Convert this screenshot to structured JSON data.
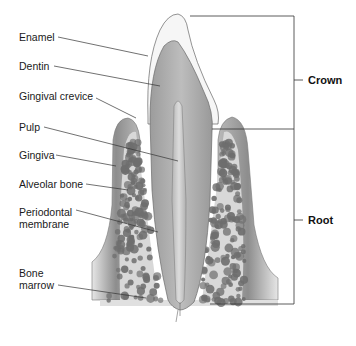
{
  "figure": {
    "colors": {
      "enamel": "#f4f4f4",
      "dentin": "#a9a9a9",
      "pulp": "#c8c8c8",
      "gingiva": "#8f8f8f",
      "alveolar_bone": "#d9d9d9",
      "bone_marrow": "#6e6e6e",
      "leader_line": "#333333"
    }
  },
  "labels": {
    "enamel": "Enamel",
    "dentin": "Dentin",
    "gingival_crevice": "Gingival crevice",
    "pulp": "Pulp",
    "gingiva": "Gingiva",
    "alveolar_bone": "Alveolar bone",
    "periodontal_membrane": "Periodontal\nmembrane",
    "bone_marrow": "Bone\nmarrow"
  },
  "regions": {
    "crown": "Crown",
    "root": "Root"
  }
}
